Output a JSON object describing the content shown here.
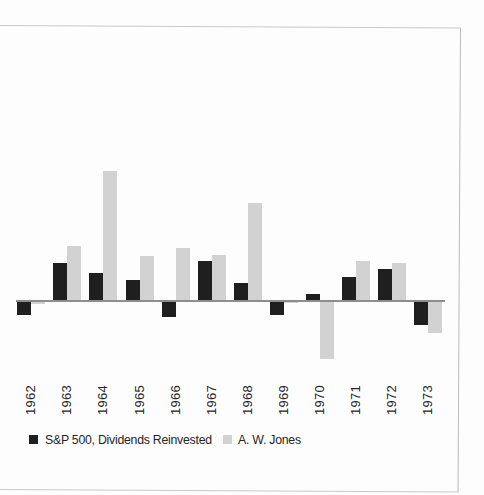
{
  "chart_data": {
    "type": "bar",
    "title": "",
    "xlabel": "",
    "ylabel": "",
    "categories": [
      "1962",
      "1963",
      "1964",
      "1965",
      "1966",
      "1967",
      "1968",
      "1969",
      "1970",
      "1971",
      "1972",
      "1973"
    ],
    "series": [
      {
        "key": "sp500",
        "name": "S&P 500, Dividends Reinvested",
        "color": "#1f1f1f",
        "values": [
          -8.7,
          22.8,
          16.8,
          12.6,
          -9.6,
          24.0,
          10.8,
          -8.4,
          3.9,
          14.4,
          19.2,
          -14.7
        ]
      },
      {
        "key": "jones",
        "name": "A. W. Jones",
        "color": "#d2d2d2",
        "values": [
          -1.8,
          32.7,
          77.7,
          26.7,
          31.8,
          27.6,
          58.8,
          -1.2,
          -35.1,
          24.0,
          22.8,
          -19.5
        ]
      }
    ],
    "axis": {
      "baseline_value": 0,
      "y_axis_labels_shown": false,
      "gridlines": false,
      "ylim_estimated": [
        -40,
        80
      ],
      "legend_position": "bottom"
    }
  },
  "legend": {
    "sp500_label": "S&P 500, Dividends Reinvested",
    "jones_label": "A. W. Jones"
  },
  "colors": {
    "sp500_bar": "#1f1f1f",
    "jones_bar": "#d2d2d2",
    "axis_line": "#8d8d8d",
    "frame_border": "#c9c9c9",
    "label_text": "#262626",
    "background": "#fdfdfd"
  }
}
